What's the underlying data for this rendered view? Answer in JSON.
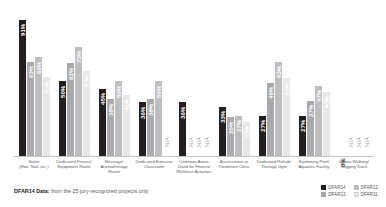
{
  "footnote": {
    "bold": "DFAR14 Data:",
    "rest": " from the 25 jury-recognized projects only"
  },
  "legend": {
    "items": [
      {
        "label": "DFAR14",
        "color": "#231f20"
      },
      {
        "label": "DFAR12",
        "color": "#bcbec0"
      },
      {
        "label": "DFAR13",
        "color": "#a7a9ac"
      },
      {
        "label": "DFAR11",
        "color": "#e6e7e8"
      }
    ]
  },
  "chart_data": {
    "type": "bar",
    "title": "",
    "xlabel": "",
    "ylabel": "",
    "ylim": [
      0,
      100
    ],
    "grid": false,
    "legend_position": "bottom-right",
    "categories": [
      "Salon\n(Hair, Nail, etc.)",
      "Dedicated Fitness/\nEquipment Room",
      "Massage/\nAromatherapy\nRoom",
      "Dedicated Exercise\nClassroom",
      "Common Areas\nUsed for Fitness/\nWellness Activities",
      "Assessment or\nTreatment Clinic",
      "Dedicated Rehab/\nTherapy Gym",
      "Swimming Pool/\nAquatics Facility",
      "Indoor Walking/\nJogging Track"
    ],
    "series": [
      {
        "name": "DFAR14",
        "values": [
          91,
          50,
          45,
          36,
          36,
          33,
          27,
          27,
          0
        ],
        "labels": [
          "91%",
          "50%",
          "45%",
          "36%",
          "36%",
          "33%",
          "27%",
          "27%",
          "0%"
        ]
      },
      {
        "name": "DFAR13",
        "values": [
          63,
          62,
          38,
          38,
          null,
          26,
          49,
          37,
          null
        ],
        "labels": [
          "63%",
          "62%",
          "38%",
          "38%",
          "N/A",
          "26%",
          "49%",
          "37%",
          "N/A"
        ]
      },
      {
        "name": "DFAR12",
        "values": [
          66,
          73,
          50,
          50,
          null,
          27,
          63,
          47,
          null
        ],
        "labels": [
          "66%",
          "73%",
          "50%",
          "50%",
          "N/A",
          "27%",
          "63%",
          "47%",
          "N/A"
        ]
      },
      {
        "name": "DFAR11",
        "values": [
          53,
          57,
          41,
          null,
          null,
          23,
          52,
          43,
          null
        ],
        "labels": [
          "53%",
          "57%",
          "41%",
          "N/A",
          "N/A",
          "23%",
          "52%",
          "43%",
          "N/A"
        ]
      }
    ]
  }
}
